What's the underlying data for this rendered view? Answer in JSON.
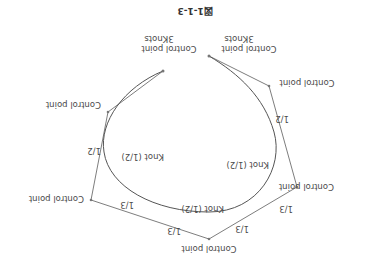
{
  "figure": {
    "title": "図1-1-3",
    "orientation": "rotated 180 degrees",
    "labels": {
      "cp_start": [
        "Control point",
        "3Knots"
      ],
      "cp_end": [
        "Control point",
        "3Knots"
      ],
      "cp": "Control point",
      "knot": "Knot (1/2)",
      "half": "1/2",
      "third": "1/3"
    },
    "colors": {
      "line": "#6e6e6e",
      "curve": "#555555",
      "text": "#4a4a4a",
      "background": "#ffffff"
    }
  }
}
